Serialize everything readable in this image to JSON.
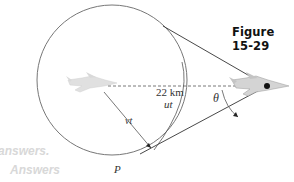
{
  "figure": {
    "title": "Figure 15-29",
    "labels": {
      "distance": "22 km",
      "ut": "ut",
      "vt": "vt",
      "theta": "θ",
      "point": "P"
    },
    "watermark": {
      "line1": "answers.",
      "line2": "Answers"
    },
    "icons": {
      "left_plane": "jet-plane-icon",
      "right_plane": "jet-plane-icon"
    },
    "colors": {
      "circle": "#777777",
      "lines": "#333333",
      "dashed": "#555555",
      "plane": "#bdbdbd",
      "watermark": "#d8d8d8"
    }
  }
}
